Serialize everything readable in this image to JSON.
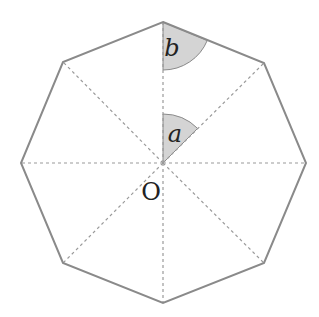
{
  "diagram": {
    "shape": "regular-octagon",
    "center": {
      "label": "O",
      "x": 163,
      "y": 163
    },
    "vertices": [
      [
        163,
        22
      ],
      [
        264,
        63
      ],
      [
        306,
        163
      ],
      [
        264,
        263
      ],
      [
        163,
        303
      ],
      [
        63,
        263
      ],
      [
        21,
        163
      ],
      [
        63,
        62
      ]
    ],
    "angles": [
      {
        "label": "a",
        "description": "central angle at O between two adjacent radii",
        "vertex": [
          163,
          163
        ]
      },
      {
        "label": "b",
        "description": "interior half-angle at top vertex",
        "vertex": [
          163,
          22
        ]
      }
    ],
    "colors": {
      "outline": "#8a8a8a",
      "radii": "#9a9a9a",
      "angle_fill": "#d4d4d4",
      "angle_stroke": "#8a8a8a",
      "text": "#222222"
    }
  }
}
